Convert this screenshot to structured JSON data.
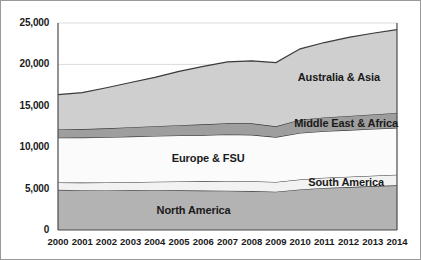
{
  "chart_data": {
    "type": "area",
    "stacked": true,
    "title": "",
    "subtitle": "",
    "xlabel": "",
    "ylabel": "",
    "grid": true,
    "legend_position": "inline-labels",
    "xlim": [
      2000,
      2014
    ],
    "ylim": [
      0,
      25000
    ],
    "categories": [
      "2000",
      "2001",
      "2002",
      "2003",
      "2004",
      "2005",
      "2006",
      "2007",
      "2008",
      "2009",
      "2010",
      "2011",
      "2012",
      "2013",
      "2014"
    ],
    "x": [
      2000,
      2001,
      2002,
      2003,
      2004,
      2005,
      2006,
      2007,
      2008,
      2009,
      2010,
      2011,
      2012,
      2013,
      2014
    ],
    "ytick_labels": [
      "0",
      "5,000",
      "10,000",
      "15,000",
      "20,000",
      "25,000"
    ],
    "ytick_values": [
      0,
      5000,
      10000,
      15000,
      20000,
      25000
    ],
    "series": [
      {
        "name": "North America",
        "color": "#b3b3b3",
        "values": [
          4850,
          4800,
          4780,
          4790,
          4800,
          4790,
          4760,
          4740,
          4700,
          4620,
          4900,
          5080,
          5180,
          5300,
          5400
        ]
      },
      {
        "name": "South America",
        "color": "#f2f2f2",
        "values": [
          900,
          930,
          960,
          990,
          1030,
          1070,
          1120,
          1180,
          1200,
          1180,
          1210,
          1230,
          1250,
          1260,
          1280
        ]
      },
      {
        "name": "Europe & FSU",
        "color": "#fbfbfb",
        "values": [
          5400,
          5430,
          5460,
          5500,
          5530,
          5560,
          5580,
          5620,
          5600,
          5420,
          5620,
          5630,
          5640,
          5650,
          5660
        ]
      },
      {
        "name": "Middle East & Africa",
        "color": "#9e9e9e",
        "values": [
          1000,
          1030,
          1080,
          1130,
          1180,
          1240,
          1300,
          1360,
          1380,
          1300,
          1600,
          1650,
          1700,
          1750,
          1800
        ]
      },
      {
        "name": "Australia & Asia",
        "color": "#cfcfcf",
        "values": [
          4200,
          4400,
          4900,
          5400,
          5900,
          6500,
          7000,
          7400,
          7550,
          7700,
          8550,
          9050,
          9500,
          9800,
          10050
        ]
      }
    ],
    "totals": [
      16350,
      16590,
      17180,
      17810,
      18440,
      19160,
      19760,
      20300,
      20430,
      20220,
      21880,
      22640,
      23270,
      23760,
      24190
    ]
  },
  "axis": {
    "y_labels": [
      "25,000",
      "20,000",
      "15,000",
      "10,000",
      "5,000",
      "0"
    ],
    "x_labels": [
      "2000",
      "2001",
      "2002",
      "2003",
      "2004",
      "2005",
      "2006",
      "2007",
      "2008",
      "2009",
      "2010",
      "2011",
      "2012",
      "2013",
      "2014"
    ]
  },
  "labels": {
    "australia_asia": "Australia & Asia",
    "middle_east_africa": "Middle East & Africa",
    "europe_fsu": "Europe & FSU",
    "south_america": "South America",
    "north_america": "North America"
  },
  "colors": {
    "north_america": "#b3b3b3",
    "south_america": "#f2f2f2",
    "europe_fsu": "#fbfbfb",
    "middle_east_africa": "#9e9e9e",
    "australia_asia": "#cfcfcf",
    "gridline": "#dcdcdc",
    "series_outline": "#3a3a3a",
    "frame": "#9a9a9a",
    "text": "#1a1a1a"
  }
}
